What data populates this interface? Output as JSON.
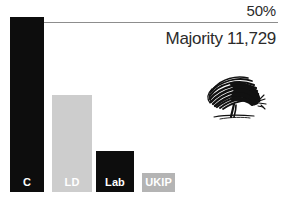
{
  "chart_data": {
    "type": "bar",
    "title": "",
    "xlabel": "",
    "ylabel": "",
    "categories": [
      "C",
      "LD",
      "Lab",
      "UKIP"
    ],
    "values": [
      50.2,
      27.7,
      11.7,
      5.4
    ],
    "ylim": [
      0,
      52
    ],
    "grid": false,
    "legend": "none",
    "annotations": [
      {
        "text": "50%",
        "type": "threshold-label",
        "value": 50
      },
      {
        "text": "Majority 11,729",
        "type": "caption"
      }
    ],
    "bars": [
      {
        "label": "C",
        "value": 50.2,
        "color": "#0d0d0d",
        "label_color": "#ffffff",
        "x": 10,
        "width": 34,
        "top": 17,
        "bottom": 192
      },
      {
        "label": "LD",
        "value": 27.7,
        "color": "#cdcdcd",
        "label_color": "#ffffff",
        "x": 52,
        "width": 40,
        "top": 95,
        "bottom": 192
      },
      {
        "label": "Lab",
        "value": 11.7,
        "color": "#0d0d0d",
        "label_color": "#ffffff",
        "x": 96,
        "width": 38,
        "top": 151,
        "bottom": 192
      },
      {
        "label": "UKIP",
        "value": 5.4,
        "color": "#b4b4b4",
        "label_color": "#ffffff",
        "x": 142,
        "width": 33,
        "top": 173,
        "bottom": 192
      }
    ],
    "threshold": {
      "label": "50%",
      "value": 50,
      "line_color": "#8d8d8d"
    },
    "caption": "Majority 11,729",
    "illustration": {
      "name": "oak-tree-sketch",
      "description": "scribbled oak tree",
      "color": "#111111"
    }
  },
  "colors": {
    "background": "#ffffff",
    "dark_bar": "#0d0d0d",
    "light_bar": "#cdcdcd",
    "mid_bar": "#b4b4b4",
    "text": "#2b2b2b",
    "line": "#8d8d8d",
    "bar_label": "#ffffff"
  }
}
